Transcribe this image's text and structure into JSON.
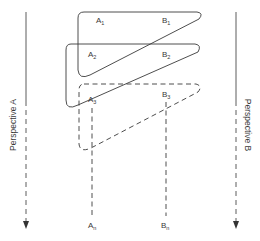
{
  "diagram": {
    "perspectives": {
      "left": {
        "label": "Perspective A"
      },
      "right": {
        "label": "Perspective B"
      }
    },
    "stages": [
      {
        "a_label": "A",
        "a_sub": "1",
        "b_label": "B",
        "b_sub": "1",
        "style": "solid"
      },
      {
        "a_label": "A",
        "a_sub": "2",
        "b_label": "B",
        "b_sub": "2",
        "style": "solid"
      },
      {
        "a_label": "A",
        "a_sub": "3",
        "b_label": "B",
        "b_sub": "3",
        "style": "dashed"
      }
    ],
    "final": {
      "a_label": "A",
      "a_sub": "n",
      "b_label": "B",
      "b_sub": "n"
    },
    "colors": {
      "line": "#3a3a3a",
      "background": "#ffffff"
    }
  }
}
